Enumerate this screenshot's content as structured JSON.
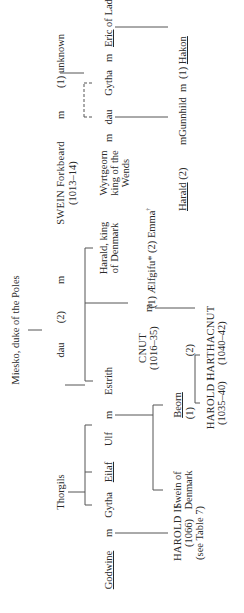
{
  "diagram": {
    "type": "genealogy-table",
    "orientation": "rotated-90-ccw",
    "people": {
      "miesko": "Miesko, duke of the Poles",
      "dau_miesko": "dau",
      "dau_miesko_marriage_num": "(2)",
      "m_swein_dau": "m",
      "swein": "SWEIN Forkbeard",
      "swein_dates": "(1013–14)",
      "m_swein_unknown": "m",
      "unknown": "(1) unknown",
      "thorgils": "Thorgils",
      "godwine": "Godwine",
      "m_godwine": "m",
      "gytha_1": "Gytha",
      "eilaf": "Eilaf",
      "ulf": "Ulf",
      "m_ulf": "m",
      "estrith": "Estrith",
      "cnut": "CNUT",
      "cnut_dates": "(1016–35)",
      "m_cnut": "m",
      "cnut_wives": "(1) Ælfgifu* (2) Emma",
      "emma_note": "†",
      "harald_king": "Harald, king",
      "harald_king_2": "of Denmark",
      "wyrtgeorn_1": "Wyrtgeorn",
      "wyrtgeorn_2": "king of the",
      "wyrtgeorn_3": "Wends",
      "m_wyrtgeorn": "m",
      "dau_2": "dau",
      "m_gytha_eric": "m",
      "gytha_2": "Gytha",
      "eric": "Eric",
      "eric_rest": " of Lade",
      "harold2": "HAROLD II",
      "harold2_dates": "(1066)",
      "harold2_note": "(see Table 7)",
      "swein_denmark_1": "Swein of",
      "swein_denmark_2": "Denmark",
      "beorn": "Beorn",
      "harold1_num": "(1)",
      "harold1": "HAROLD I",
      "harold1_dates": "(1035–40)",
      "harthacnut_num": "(2)",
      "harthacnut": "HARTHACNUT",
      "harthacnut_dates": "(1040–42)",
      "harald_2": "Harald",
      "harald_2_num": " (2)",
      "m_gunnhild": "m",
      "gunnhild": "Gunnhild",
      "m_hakon": "m",
      "hakon_num": "(1) ",
      "hakon": "Hakon"
    }
  }
}
